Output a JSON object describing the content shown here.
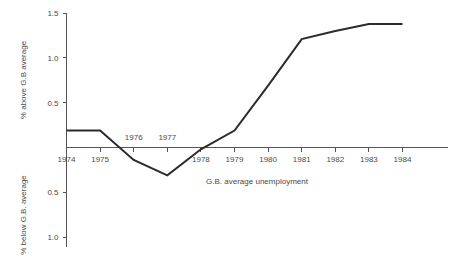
{
  "chart_data": {
    "type": "line",
    "title": "",
    "subtitle": "",
    "xlabel": "G.B. average unemployment",
    "ylabel_upper": "% above G.B average",
    "ylabel_lower": "% below G.B. average",
    "grid": false,
    "legend": "none",
    "categories": [
      "1974",
      "1975",
      "1976",
      "1977",
      "1978",
      "1979",
      "1980",
      "1981",
      "1982",
      "1983",
      "1984"
    ],
    "x": [
      1974,
      1975,
      1976,
      1977,
      1978,
      1979,
      1980,
      1981,
      1982,
      1983,
      1984
    ],
    "values": [
      0.19,
      0.19,
      -0.14,
      -0.31,
      -0.02,
      0.19,
      0.69,
      1.21,
      1.3,
      1.38,
      1.38
    ],
    "ylim": [
      -1.1,
      1.6
    ],
    "xlim": [
      1973.6,
      1984.7
    ],
    "yticks_upper": [
      "1.5",
      "1.0",
      "0.5"
    ],
    "yticks_upper_values": [
      1.5,
      1.0,
      0.5
    ],
    "yticks_lower": [
      "0.5",
      "1.0"
    ],
    "yticks_lower_values": [
      -0.5,
      -1.0
    ],
    "xtick_labels_below": [
      "1974",
      "1975",
      "1978",
      "1979",
      "1980",
      "1981",
      "1982",
      "1983",
      "1984"
    ],
    "xtick_labels_above": [
      "1976",
      "1977"
    ],
    "zero_line_value": 0,
    "series": [
      {
        "name": "deviation from G.B. average unemployment",
        "values": [
          0.19,
          0.19,
          -0.14,
          -0.31,
          -0.02,
          0.19,
          0.69,
          1.21,
          1.3,
          1.38,
          1.38
        ]
      }
    ],
    "colors": {
      "series_line": "#2b2b2b",
      "axis": "#555555",
      "text": "#4a4a4a",
      "background": "#ffffff"
    }
  }
}
